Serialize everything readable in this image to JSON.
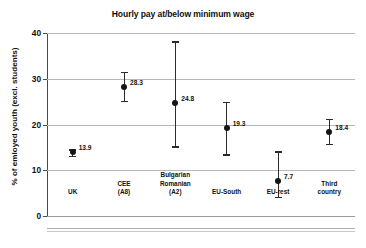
{
  "chart_data": {
    "type": "scatter",
    "title": "Hourly pay at/below minimum wage",
    "xlabel": "",
    "ylabel": "% of emloyed youth (excl. students)",
    "ylim": [
      0,
      40
    ],
    "yticks": [
      0,
      10,
      20,
      30,
      40
    ],
    "ytick_labels": [
      "0",
      "10",
      "20",
      "30",
      "40"
    ],
    "grid": true,
    "legend": "none",
    "categories": [
      "UK",
      "CEE (A8)",
      "Bulgarian Romanian (A2)",
      "EU-South",
      "EU-rest",
      "Third country"
    ],
    "category_label_lines": [
      [
        "UK"
      ],
      [
        "CEE",
        "(A8)"
      ],
      [
        "Bulgarian",
        "Romanian",
        "(A2)"
      ],
      [
        "EU-South"
      ],
      [
        "EU-rest"
      ],
      [
        "Third",
        "country"
      ]
    ],
    "values": [
      13.9,
      28.3,
      24.8,
      19.3,
      7.7,
      18.4
    ],
    "value_labels": [
      "13.9",
      "28.3",
      "24.8",
      "19.3",
      "7.7",
      "18.4"
    ],
    "error_low": [
      13.2,
      25.1,
      15.2,
      13.5,
      4.2,
      15.8
    ],
    "error_high": [
      14.6,
      31.5,
      38.2,
      24.9,
      14.1,
      21.3
    ],
    "series": [
      {
        "name": "Hourly pay at/below minimum wage",
        "values": [
          13.9,
          28.3,
          24.8,
          19.3,
          7.7,
          18.4
        ],
        "error_low": [
          13.2,
          25.1,
          15.2,
          13.5,
          4.2,
          15.8
        ],
        "error_high": [
          14.6,
          31.5,
          38.2,
          24.9,
          14.1,
          21.3
        ]
      }
    ],
    "marker_color": "#151515",
    "errorbar_color": "#2b2b2b",
    "grid_color": "#b8b8b8",
    "background_color": "#ffffff"
  }
}
